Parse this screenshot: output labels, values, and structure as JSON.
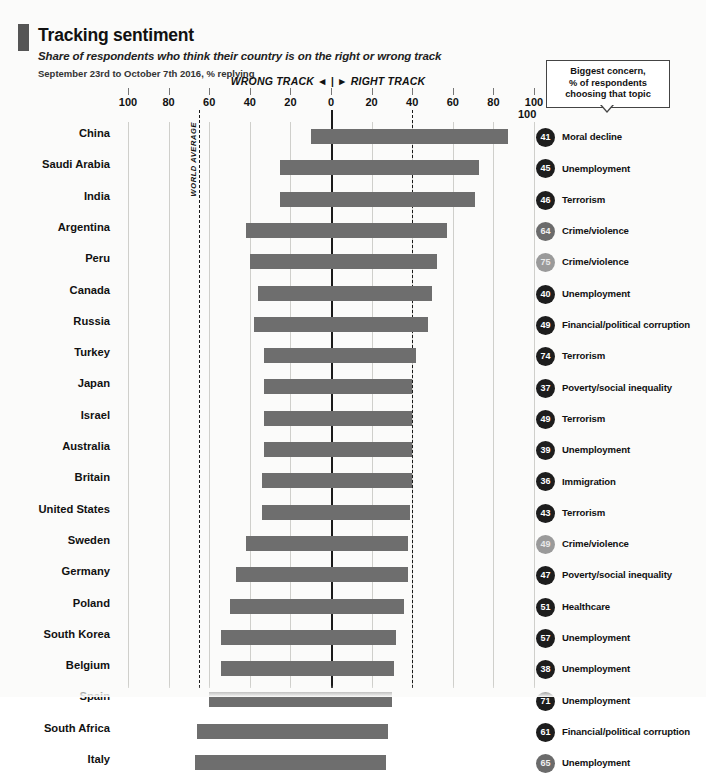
{
  "header": {
    "title": "Tracking sentiment",
    "subtitle": "Share of respondents who think their country is on the right or wrong track",
    "daterange": "September 23rd to October 7th 2016, % replying",
    "direction_label": "WRONG TRACK ◄ | ► RIGHT TRACK"
  },
  "legend": {
    "box_line1": "Biggest concern,",
    "box_line2": "% of respondents",
    "box_line3": "choosing that topic",
    "top_scale": "100"
  },
  "annotations": {
    "world_average": "WORLD AVERAGE",
    "world_average_value": -65,
    "right_dashed_value": 40
  },
  "colors": {
    "bar": "#6e6e6e",
    "dot": "#1d1d1d",
    "zero_line": "#1a1a1a",
    "grid": "#cfcfcb",
    "accent_tab": "#555555"
  },
  "chart_data": {
    "type": "bar",
    "title": "Tracking sentiment",
    "subtitle": "Share of respondents who think their country is on the right or wrong track",
    "xlabel": "WRONG TRACK ◄ | ► RIGHT TRACK",
    "ylabel": "",
    "xlim": [
      -100,
      100
    ],
    "xticks": [
      -100,
      -80,
      -60,
      -40,
      -20,
      0,
      20,
      40,
      60,
      80,
      100
    ],
    "xticklabels": [
      "100",
      "80",
      "60",
      "40",
      "20",
      "0",
      "20",
      "40",
      "60",
      "80",
      "100"
    ],
    "grid": true,
    "legend_position": "right",
    "note": "Each bar spans from the % saying wrong track (negative side) to the % saying right track (positive side).",
    "categories": [
      "China",
      "Saudi Arabia",
      "India",
      "Argentina",
      "Peru",
      "Canada",
      "Russia",
      "Turkey",
      "Japan",
      "Israel",
      "Australia",
      "Britain",
      "United States",
      "Sweden",
      "Germany",
      "Poland",
      "South Korea",
      "Belgium",
      "Spain",
      "South Africa",
      "Italy"
    ],
    "series": [
      {
        "name": "Wrong track (%)",
        "values": [
          10,
          25,
          25,
          42,
          40,
          36,
          38,
          33,
          33,
          33,
          33,
          34,
          34,
          42,
          47,
          50,
          54,
          54,
          60,
          66,
          67
        ]
      },
      {
        "name": "Right track (%)",
        "values": [
          87,
          73,
          71,
          57,
          52,
          50,
          48,
          42,
          40,
          40,
          40,
          40,
          39,
          38,
          38,
          36,
          32,
          31,
          30,
          28,
          27
        ]
      }
    ],
    "concerns": [
      {
        "country": "China",
        "value": 41,
        "topic": "Moral decline",
        "shade": "dark"
      },
      {
        "country": "Saudi Arabia",
        "value": 45,
        "topic": "Unemployment",
        "shade": "dark"
      },
      {
        "country": "India",
        "value": 46,
        "topic": "Terrorism",
        "shade": "dark"
      },
      {
        "country": "Argentina",
        "value": 64,
        "topic": "Crime/violence",
        "shade": "mid"
      },
      {
        "country": "Peru",
        "value": 75,
        "topic": "Crime/violence",
        "shade": "faded"
      },
      {
        "country": "Canada",
        "value": 40,
        "topic": "Unemployment",
        "shade": "dark"
      },
      {
        "country": "Russia",
        "value": 49,
        "topic": "Financial/political corruption",
        "shade": "dark"
      },
      {
        "country": "Turkey",
        "value": 74,
        "topic": "Terrorism",
        "shade": "dark"
      },
      {
        "country": "Japan",
        "value": 37,
        "topic": "Poverty/social inequality",
        "shade": "dark"
      },
      {
        "country": "Israel",
        "value": 49,
        "topic": "Terrorism",
        "shade": "dark"
      },
      {
        "country": "Australia",
        "value": 39,
        "topic": "Unemployment",
        "shade": "dark"
      },
      {
        "country": "Britain",
        "value": 36,
        "topic": "Immigration",
        "shade": "dark"
      },
      {
        "country": "United States",
        "value": 43,
        "topic": "Terrorism",
        "shade": "dark"
      },
      {
        "country": "Sweden",
        "value": 49,
        "topic": "Crime/violence",
        "shade": "faded"
      },
      {
        "country": "Germany",
        "value": 47,
        "topic": "Poverty/social inequality",
        "shade": "dark"
      },
      {
        "country": "Poland",
        "value": 51,
        "topic": "Healthcare",
        "shade": "dark"
      },
      {
        "country": "South Korea",
        "value": 57,
        "topic": "Unemployment",
        "shade": "dark"
      },
      {
        "country": "Belgium",
        "value": 38,
        "topic": "Unemployment",
        "shade": "dark"
      },
      {
        "country": "Spain",
        "value": 71,
        "topic": "Unemployment",
        "shade": "dark"
      },
      {
        "country": "South Africa",
        "value": 61,
        "topic": "Financial/political corruption",
        "shade": "dark"
      },
      {
        "country": "Italy",
        "value": 65,
        "topic": "Unemployment",
        "shade": "mid"
      }
    ]
  }
}
